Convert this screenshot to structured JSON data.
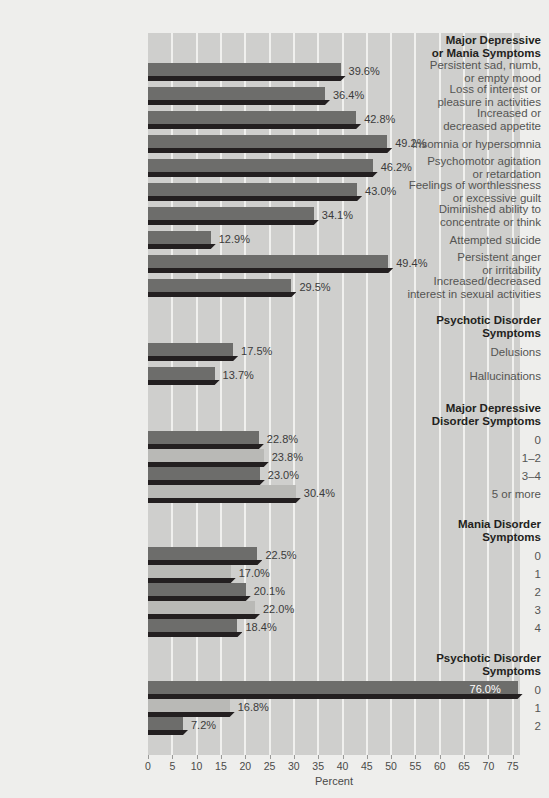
{
  "chart_data": {
    "type": "bar",
    "orientation": "horizontal",
    "title": "",
    "xlabel": "Percent",
    "ylabel": "",
    "xlim": [
      0,
      76.5
    ],
    "xticks": [
      0,
      5,
      10,
      15,
      20,
      25,
      30,
      35,
      40,
      45,
      50,
      55,
      60,
      65,
      70,
      75
    ],
    "xticklabels": [
      "0",
      "5",
      "10",
      "15",
      "20",
      "25",
      "30",
      "35",
      "40",
      "45",
      "50",
      "55",
      "60",
      "65",
      "70",
      "75"
    ],
    "grid": true,
    "legend": null,
    "groups": [
      {
        "heading": "Major Depressive\nor Mania Symptoms",
        "items": [
          {
            "label": "Persistent sad, numb,\nor empty mood",
            "value": 39.6,
            "value_label": "39.6%"
          },
          {
            "label": "Loss of interest or\npleasure in activities",
            "value": 36.4,
            "value_label": "36.4%"
          },
          {
            "label": "Increased or\ndecreased appetite",
            "value": 42.8,
            "value_label": "42.8%"
          },
          {
            "label": "Insomnia or hypersomnia",
            "value": 49.2,
            "value_label": "49.2%"
          },
          {
            "label": "Psychomotor agitation\nor retardation",
            "value": 46.2,
            "value_label": "46.2%"
          },
          {
            "label": "Feelings of worthlessness\nor excessive guilt",
            "value": 43.0,
            "value_label": "43.0%"
          },
          {
            "label": "Diminished ability to\nconcentrate or think",
            "value": 34.1,
            "value_label": "34.1%"
          },
          {
            "label": "Attempted suicide",
            "value": 12.9,
            "value_label": "12.9%"
          },
          {
            "label": "Persistent anger\nor irritability",
            "value": 49.4,
            "value_label": "49.4%"
          },
          {
            "label": "Increased/decreased\ninterest in sexual activities",
            "value": 29.5,
            "value_label": "29.5%"
          }
        ]
      },
      {
        "heading": "Psychotic Disorder\nSymptoms",
        "items": [
          {
            "label": "Delusions",
            "value": 17.5,
            "value_label": "17.5%"
          },
          {
            "label": "Hallucinations",
            "value": 13.7,
            "value_label": "13.7%"
          }
        ]
      },
      {
        "heading": "Major Depressive\nDisorder Symptoms",
        "items": [
          {
            "label": "0",
            "value": 22.8,
            "value_label": "22.8%"
          },
          {
            "label": "1–2",
            "value": 23.8,
            "value_label": "23.8%"
          },
          {
            "label": "3–4",
            "value": 23.0,
            "value_label": "23.0%"
          },
          {
            "label": "5 or more",
            "value": 30.4,
            "value_label": "30.4%"
          }
        ]
      },
      {
        "heading": "Mania Disorder\nSymptoms",
        "items": [
          {
            "label": "0",
            "value": 22.5,
            "value_label": "22.5%"
          },
          {
            "label": "1",
            "value": 17.0,
            "value_label": "17.0%"
          },
          {
            "label": "2",
            "value": 20.1,
            "value_label": "20.1%"
          },
          {
            "label": "3",
            "value": 22.0,
            "value_label": "22.0%"
          },
          {
            "label": "4",
            "value": 18.4,
            "value_label": "18.4%"
          }
        ]
      },
      {
        "heading": "Psychotic Disorder\nSymptoms",
        "items": [
          {
            "label": "0",
            "value": 76.0,
            "value_label": "76.0%"
          },
          {
            "label": "1",
            "value": 16.8,
            "value_label": "16.8%"
          },
          {
            "label": "2",
            "value": 7.2,
            "value_label": "7.2%"
          }
        ]
      }
    ]
  },
  "colors": {
    "page_background": "#eeeeec",
    "plot_background": "#cfcfcd",
    "gridline": "#f0f0ee",
    "bar_dark": "#6d6d6b",
    "bar_light": "#b9b9b6",
    "bar_shadow": "#231f20",
    "label_text": "#555553",
    "heading_text": "#231f20",
    "value_text": "#3b3b3b",
    "value_text_inside": "#ffffff"
  },
  "axis": {
    "title": "Percent"
  }
}
